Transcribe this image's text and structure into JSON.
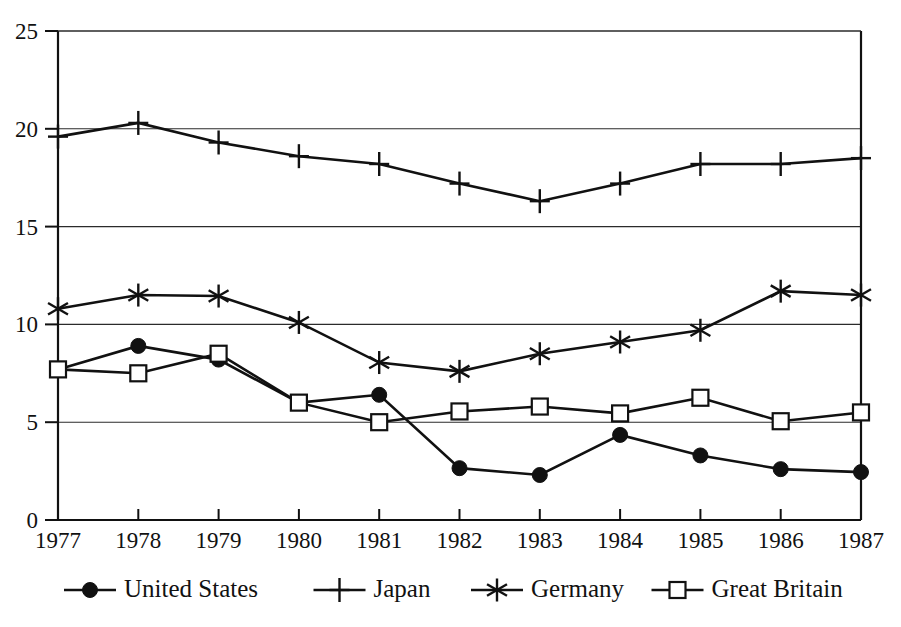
{
  "chart_data": {
    "type": "line",
    "title": "",
    "subtitle": "",
    "xlabel": "",
    "ylabel": "",
    "x": [
      1977,
      1978,
      1979,
      1980,
      1981,
      1982,
      1983,
      1984,
      1985,
      1986,
      1987
    ],
    "categories": [
      "1977",
      "1978",
      "1979",
      "1980",
      "1981",
      "1982",
      "1983",
      "1984",
      "1985",
      "1986",
      "1987"
    ],
    "xlim": [
      1977,
      1987
    ],
    "ylim": [
      0,
      25
    ],
    "y_ticks": [
      0,
      5,
      10,
      15,
      20,
      25
    ],
    "y_tick_labels": [
      "0",
      "5",
      "10",
      "15",
      "20",
      "25"
    ],
    "grid": "horizontal",
    "legend_position": "bottom",
    "series": [
      {
        "name": "United States",
        "marker": "filled-circle",
        "values": [
          7.7,
          8.9,
          8.2,
          6.0,
          6.4,
          2.65,
          2.3,
          4.35,
          3.3,
          2.6,
          2.45
        ]
      },
      {
        "name": "Japan",
        "marker": "plus",
        "values": [
          19.6,
          20.3,
          19.3,
          18.6,
          18.2,
          17.2,
          16.3,
          17.2,
          18.2,
          18.2,
          18.5
        ]
      },
      {
        "name": "Germany",
        "marker": "asterisk",
        "values": [
          10.8,
          11.5,
          11.45,
          10.1,
          8.05,
          7.6,
          8.5,
          9.1,
          9.7,
          11.7,
          11.5
        ]
      },
      {
        "name": "Great Britain",
        "marker": "open-square",
        "values": [
          7.7,
          7.5,
          8.5,
          6.0,
          5.0,
          5.55,
          5.8,
          5.45,
          6.25,
          5.05,
          5.5
        ]
      }
    ]
  },
  "legend": {
    "items": [
      {
        "label": "United States",
        "marker": "filled-circle"
      },
      {
        "label": "Japan",
        "marker": "plus"
      },
      {
        "label": "Germany",
        "marker": "asterisk"
      },
      {
        "label": "Great Britain",
        "marker": "open-square"
      }
    ]
  },
  "colors": {
    "ink": "#111111",
    "grid": "#2b2b2b",
    "background": "#ffffff",
    "marker_fill": "#ffffff"
  }
}
